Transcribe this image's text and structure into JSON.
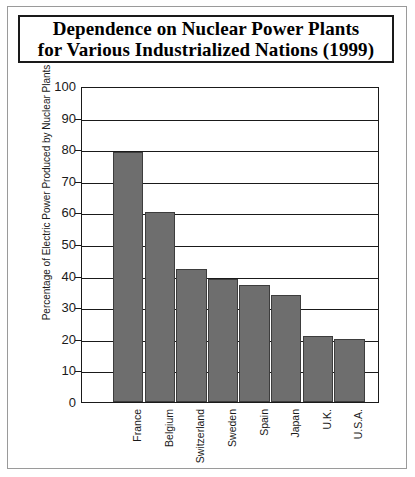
{
  "figure": {
    "title_line1": "Dependence on Nuclear Power Plants",
    "title_line2": "for Various Industrialized Nations (1999)"
  },
  "chart_data": {
    "type": "bar",
    "title": "Dependence on Nuclear Power Plants for Various Industrialized Nations (1999)",
    "categories": [
      "France",
      "Belgium",
      "Switzerland",
      "Sweden",
      "Spain",
      "Japan",
      "U.K.",
      "U.S.A."
    ],
    "values": [
      79,
      60,
      42,
      39,
      37,
      34,
      21,
      20
    ],
    "xlabel": "",
    "ylabel": "Percentage of Electric Power Produced by Nuclear Plants",
    "ylim": [
      0,
      100
    ],
    "ytick_labels": [
      "100",
      "90",
      "80",
      "70",
      "60",
      "50",
      "40",
      "30",
      "20",
      "10",
      "0"
    ],
    "ytick_values": [
      100,
      90,
      80,
      70,
      60,
      50,
      40,
      30,
      20,
      10,
      0
    ],
    "grid": true,
    "legend": "none",
    "bar_color": "#6e6e6e",
    "axis_color": "#1a1a1a",
    "background": "#ffffff"
  }
}
